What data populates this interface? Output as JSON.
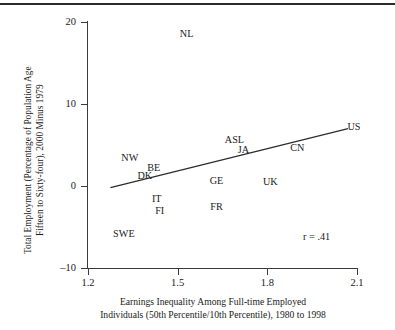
{
  "chart_data": {
    "type": "scatter",
    "title": "",
    "xlabel": "Earnings Inequality Among Full-time Employed\nIndividuals (50th Percentile/10th Percentile), 1980 to 1998",
    "ylabel": "Total Employment (Percentage of Population Age\nFifteen to Sixty-four), 2000 Minus 1979",
    "xlim": [
      1.2,
      2.1
    ],
    "ylim": [
      -10,
      20
    ],
    "xticks": [
      "1.2",
      "1.5",
      "1.8",
      "2.1"
    ],
    "xtick_values": [
      1.2,
      1.5,
      1.8,
      2.1
    ],
    "yticks": [
      "20",
      "10",
      "0",
      "–10"
    ],
    "ytick_values": [
      20,
      10,
      0,
      -10
    ],
    "grid": false,
    "legend": "none",
    "point_marker": "text-label",
    "annotation": "r = .41",
    "correlation": 0.41,
    "trendline": {
      "type": "linear",
      "x_start": 1.275,
      "y_start": -0.2,
      "x_end": 2.07,
      "y_end": 7.0
    },
    "points": [
      {
        "label": "NL",
        "x": 1.53,
        "y": 18.5
      },
      {
        "label": "US",
        "x": 2.09,
        "y": 7.2
      },
      {
        "label": "ASL",
        "x": 1.69,
        "y": 5.6
      },
      {
        "label": "JA",
        "x": 1.72,
        "y": 4.4
      },
      {
        "label": "CN",
        "x": 1.9,
        "y": 4.6
      },
      {
        "label": "NW",
        "x": 1.34,
        "y": 3.4
      },
      {
        "label": "BE",
        "x": 1.42,
        "y": 2.2
      },
      {
        "label": "DK",
        "x": 1.39,
        "y": 1.2
      },
      {
        "label": "GE",
        "x": 1.63,
        "y": 0.6
      },
      {
        "label": "UK",
        "x": 1.81,
        "y": 0.5
      },
      {
        "label": "IT",
        "x": 1.43,
        "y": -1.6
      },
      {
        "label": "FR",
        "x": 1.63,
        "y": -2.6
      },
      {
        "label": "FI",
        "x": 1.44,
        "y": -3.1
      },
      {
        "label": "SWE",
        "x": 1.32,
        "y": -5.8
      }
    ]
  }
}
